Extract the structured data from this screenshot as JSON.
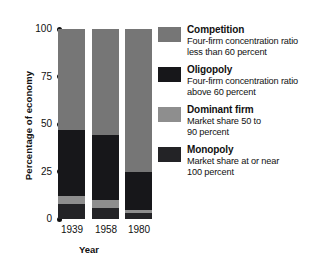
{
  "chart_data": {
    "type": "bar",
    "subtype": "stacked-100-percent",
    "title": "",
    "xlabel": "Year",
    "ylabel": "Percentage of economy",
    "categories": [
      "1939",
      "1958",
      "1980"
    ],
    "ylim": [
      0,
      100
    ],
    "yticks": [
      0,
      25,
      50,
      75,
      100
    ],
    "ytick_labels": [
      "0",
      "25",
      "50",
      "75",
      "100"
    ],
    "grid": false,
    "legend_position": "right",
    "series": [
      {
        "name": "Competition",
        "description_line_1": "Four-firm concentration ratio",
        "description_line_2": "less than 60 percent",
        "color": "#767676",
        "values": [
          53,
          56,
          75
        ]
      },
      {
        "name": "Oligopoly",
        "description_line_1": "Four-firm concentration ratio",
        "description_line_2": "above 60 percent",
        "color": "#17171a",
        "values": [
          35,
          34,
          20
        ]
      },
      {
        "name": "Dominant firm",
        "description_line_1": "Market share 50 to",
        "description_line_2": "90 percent",
        "color": "#8e8e8e",
        "values": [
          4,
          4,
          2
        ]
      },
      {
        "name": "Monopoly",
        "description_line_1": "Market share at or near",
        "description_line_2": "100 percent",
        "color": "#232326",
        "values": [
          8,
          6,
          3
        ]
      }
    ]
  },
  "axes": {
    "y_title": "Percentage of economy",
    "x_title": "Year",
    "y_ticks": [
      {
        "label": "100",
        "value": 100
      },
      {
        "label": "75",
        "value": 75
      },
      {
        "label": "50",
        "value": 50
      },
      {
        "label": "25",
        "value": 25
      },
      {
        "label": "0",
        "value": 0
      }
    ],
    "x_ticks": [
      "1939",
      "1958",
      "1980"
    ]
  },
  "legend": {
    "items": [
      {
        "label": "Competition",
        "line1": "Four-firm concentration ratio",
        "line2": "less than 60 percent",
        "color": "#767676"
      },
      {
        "label": "Oligopoly",
        "line1": "Four-firm concentration ratio",
        "line2": "above 60 percent",
        "color": "#17171a"
      },
      {
        "label": "Dominant firm",
        "line1": "Market share 50 to",
        "line2": "90 percent",
        "color": "#8e8e8e"
      },
      {
        "label": "Monopoly",
        "line1": "Market share at or near",
        "line2": "100 percent",
        "color": "#232326"
      }
    ]
  }
}
